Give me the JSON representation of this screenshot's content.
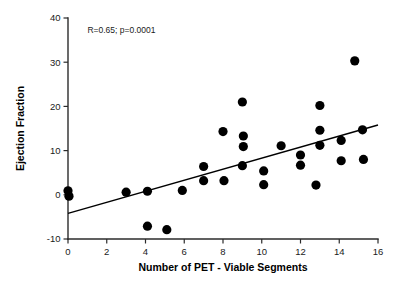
{
  "chart_data": {
    "type": "scatter",
    "title": "",
    "xlabel": "Number of PET - Viable Segments",
    "ylabel": "Ejection Fraction",
    "xlim": [
      0,
      16
    ],
    "ylim": [
      -10,
      40
    ],
    "xticks": [
      0,
      2,
      4,
      6,
      8,
      10,
      12,
      14,
      16
    ],
    "yticks": [
      -10,
      0,
      10,
      20,
      30,
      40
    ],
    "xtick_labels": [
      "0",
      "2",
      "4",
      "6",
      "8",
      "10",
      "12",
      "14",
      "16"
    ],
    "ytick_labels": [
      "-10",
      "0",
      "10",
      "20",
      "30",
      "40"
    ],
    "grid": false,
    "legend": "none",
    "annotation": "R=0.65; p=0.0001",
    "annotation_x": 1.0,
    "annotation_y": 36.5,
    "marker_color": "#000000",
    "marker_size": 4.6,
    "line_color": "#000000",
    "axis_color": "#2b2b2b",
    "correlation_r": 0.65,
    "p_value": 0.0001,
    "fit_line": {
      "x": [
        0,
        16
      ],
      "y": [
        -4.2,
        15.8
      ],
      "slope": 1.25,
      "intercept": -4.2
    },
    "points": [
      {
        "x": 0.0,
        "y": 0.9
      },
      {
        "x": 0.05,
        "y": -0.3
      },
      {
        "x": 3.0,
        "y": 0.6
      },
      {
        "x": 4.1,
        "y": 0.8
      },
      {
        "x": 4.1,
        "y": -7.1
      },
      {
        "x": 5.1,
        "y": -7.9
      },
      {
        "x": 5.9,
        "y": 1.0
      },
      {
        "x": 7.0,
        "y": 6.4
      },
      {
        "x": 7.0,
        "y": 3.2
      },
      {
        "x": 8.0,
        "y": 14.3
      },
      {
        "x": 8.05,
        "y": 3.2
      },
      {
        "x": 9.0,
        "y": 21.0
      },
      {
        "x": 9.05,
        "y": 13.3
      },
      {
        "x": 9.05,
        "y": 10.9
      },
      {
        "x": 9.0,
        "y": 6.6
      },
      {
        "x": 10.1,
        "y": 5.4
      },
      {
        "x": 10.1,
        "y": 2.3
      },
      {
        "x": 11.0,
        "y": 11.1
      },
      {
        "x": 12.0,
        "y": 9.0
      },
      {
        "x": 12.0,
        "y": 6.7
      },
      {
        "x": 13.0,
        "y": 20.2
      },
      {
        "x": 13.0,
        "y": 14.6
      },
      {
        "x": 13.0,
        "y": 11.2
      },
      {
        "x": 12.8,
        "y": 2.2
      },
      {
        "x": 14.1,
        "y": 12.3
      },
      {
        "x": 14.1,
        "y": 7.7
      },
      {
        "x": 14.8,
        "y": 30.3
      },
      {
        "x": 15.2,
        "y": 14.7
      },
      {
        "x": 15.25,
        "y": 8.0
      }
    ]
  }
}
